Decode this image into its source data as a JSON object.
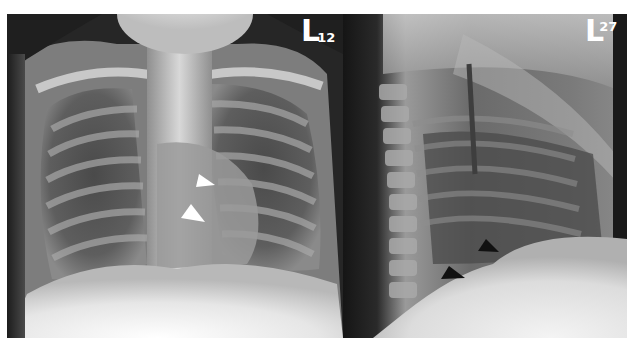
{
  "figure": {
    "panels": [
      {
        "id": "frontal",
        "view": "frontal chest radiograph",
        "marker_letter": "L",
        "marker_number": "12",
        "arrowheads": {
          "count": 2,
          "color": "#ffffff"
        }
      },
      {
        "id": "lateral",
        "view": "lateral chest radiograph",
        "marker_letter": "L",
        "marker_number": "27",
        "arrowheads": {
          "count": 2,
          "color": "#111111"
        }
      }
    ],
    "colors": {
      "background": "#ffffff",
      "film_dark": "#1a1a1a",
      "bone_light": "#f2f2f2"
    }
  }
}
